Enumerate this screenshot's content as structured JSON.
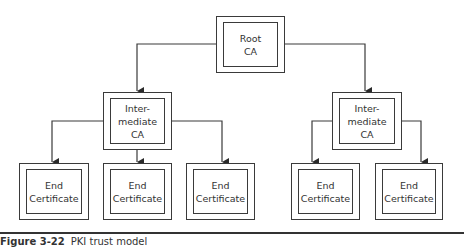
{
  "diagram": {
    "type": "hierarchy",
    "nodes": {
      "root": {
        "line1": "Root",
        "line2": "CA"
      },
      "intermediate_left": {
        "line1": "Inter-",
        "line2": "mediate",
        "line3": "CA"
      },
      "intermediate_right": {
        "line1": "Inter-",
        "line2": "mediate",
        "line3": "CA"
      },
      "end_1": {
        "line1": "End",
        "line2": "Certificate"
      },
      "end_2": {
        "line1": "End",
        "line2": "Certificate"
      },
      "end_3": {
        "line1": "End",
        "line2": "Certificate"
      },
      "end_4": {
        "line1": "End",
        "line2": "Certificate"
      },
      "end_5": {
        "line1": "End",
        "line2": "Certificate"
      }
    },
    "edges": [
      [
        "root",
        "intermediate_left"
      ],
      [
        "root",
        "intermediate_right"
      ],
      [
        "intermediate_left",
        "end_1"
      ],
      [
        "intermediate_left",
        "end_2"
      ],
      [
        "intermediate_left",
        "end_3"
      ],
      [
        "intermediate_right",
        "end_4"
      ],
      [
        "intermediate_right",
        "end_5"
      ]
    ],
    "colors": {
      "stroke": "#3a3a3a",
      "background": "#ffffff",
      "text": "#333333"
    }
  },
  "caption": {
    "figure_number": "Figure 3-22",
    "text": "PKI trust model"
  }
}
